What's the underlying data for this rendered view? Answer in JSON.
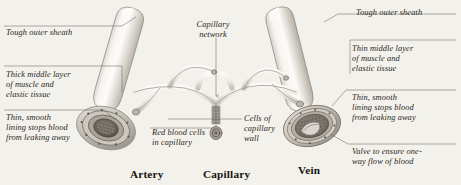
{
  "figure": {
    "background_color": "#f3f1ec",
    "ink_color": "#2e2b28",
    "style": "pencil-shaded anatomical textbook illustration"
  },
  "labels": {
    "tough_outer_sheath_artery": "Tough outer sheath",
    "thick_middle_layer": "Thick middle layer\nof muscle and\nelastic tissue",
    "thin_smooth_lining_artery": "Thin, smooth\nlining stops blood\nfrom leaking away",
    "capillary_network": "Capillary\nnetwork",
    "red_blood_cells": "Red blood cells\nin capillary",
    "cells_of_capillary_wall": "Cells of\ncapillary\nwall",
    "tough_outer_sheath_vein": "Tough outer sheath",
    "thin_middle_layer": "Thin middle layer\nof muscle and\nelastic tissue",
    "thin_smooth_lining_vein": "Thin, smooth\nlining stops blood\nfrom leaking away",
    "valve": "Valve to ensure one-\nway flow of blood"
  },
  "captions": {
    "artery": "Artery",
    "capillary": "Capillary",
    "vein": "Vein"
  },
  "structures": {
    "artery_vessel": "artery-cylinder",
    "vein_vessel": "vein-cylinder",
    "capillary_bed": "capillary-branch-network",
    "artery_cross_section": "artery-cut-end",
    "vein_cross_section": "vein-cut-end",
    "valve_flap": "vein-valve"
  }
}
